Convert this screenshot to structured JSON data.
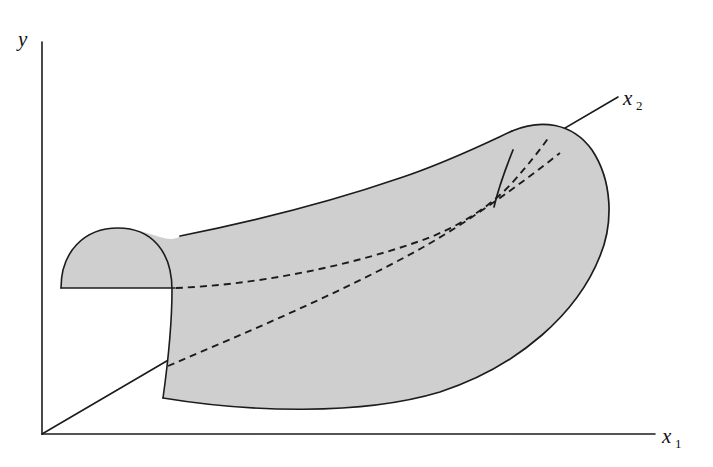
{
  "figure": {
    "kind": "3d-surface-sketch",
    "title": "",
    "background_color": "#ffffff",
    "surface_fill_color": "#cfcfcf",
    "line_color": "#1c1c1c",
    "axes": [
      {
        "id": "y",
        "label": "y",
        "subscript": "",
        "name": "y-axis",
        "orientation": "vertical",
        "from": [
          42,
          434
        ],
        "to": [
          42,
          42
        ]
      },
      {
        "id": "x1",
        "label": "x",
        "subscript": "1",
        "name": "x1-axis",
        "orientation": "horizontal",
        "from": [
          42,
          434
        ],
        "to": [
          655,
          434
        ]
      },
      {
        "id": "x2",
        "label": "x",
        "subscript": "2",
        "name": "x2-axis",
        "orientation": "diagonal",
        "from": [
          42,
          434
        ],
        "to": [
          618,
          97
        ]
      }
    ],
    "labels": {
      "y": "y",
      "x1": "x",
      "x1_subscript": "1",
      "x2": "x",
      "x2_subscript": "2"
    },
    "surface": {
      "description": "curved ridge surface over the x1-x2 plane",
      "outline_path": "M 61 288 C 61 252, 84 228, 118 228 C 152 228, 178 248, 196 232 C 260 218, 330 200, 400 178 C 448 163, 486 143, 512 131 C 540 119, 572 122, 592 150 C 612 180, 614 222, 600 256 C 578 312, 520 366, 440 392 C 360 416, 250 412, 163 398 C 163 398, 170 340, 172 288 Z",
      "top_ridge_path": "M 196 232 C 260 218, 330 200, 400 178 C 448 163, 486 143, 512 131",
      "bottom_edge_path": "M 163 398 C 250 412, 360 416, 440 392 C 520 366, 578 312, 600 256",
      "right_cap_path": "M 512 131 C 540 119, 572 122, 592 150 C 612 180, 614 222, 600 256",
      "left_cap_dome_path": "M 61 288 C 61 252, 84 228, 118 228 C 152 228, 172 252, 172 288 C 172 330, 168 366, 163 398",
      "left_cap_base_path": "M 61 288 L 172 288",
      "crease_path": "M 511 152 L 494 206",
      "dashed_curves": [
        {
          "name": "back-base-curve",
          "description": "dashed back bottom edge of surface running from left cap base to right cap",
          "path": "M 176 288 C 250 284, 340 268, 420 240 C 460 226, 492 204, 512 182 C 528 164, 540 150, 548 138"
        },
        {
          "name": "x2-axis-hidden-continuation",
          "description": "dashed continuation of x2 axis passing beneath/through the surface",
          "path": "M 168 366 C 250 330, 340 292, 420 248 C 470 220, 520 182, 560 152"
        }
      ]
    }
  }
}
